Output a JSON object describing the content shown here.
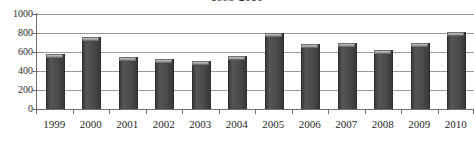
{
  "chart_data": {
    "type": "bar",
    "title": "1999-2010",
    "xlabel": "",
    "ylabel": "",
    "categories": [
      "1999",
      "2000",
      "2001",
      "2002",
      "2003",
      "2004",
      "2005",
      "2006",
      "2007",
      "2008",
      "2009",
      "2010"
    ],
    "values": [
      580,
      760,
      545,
      525,
      505,
      555,
      800,
      680,
      700,
      620,
      700,
      810
    ],
    "series": [
      {
        "name": "",
        "values": [
          580,
          760,
          545,
          525,
          505,
          555,
          800,
          680,
          700,
          620,
          700,
          810
        ]
      }
    ],
    "ylim": [
      0,
      1000
    ],
    "y_ticks": [
      1000,
      800,
      600,
      400,
      200,
      0
    ],
    "y_tick_labels": [
      "1000",
      "800",
      "600",
      "400",
      "200",
      "0"
    ],
    "grid": true,
    "legend": false,
    "legend_position": "none",
    "bar_color": "#4a4a4a",
    "bar_cap_color": "#a8a8a8",
    "gridline_color": "#9a9a9a",
    "axis_color": "#6e6e6e",
    "background_color": "#ffffff",
    "annotations": []
  }
}
